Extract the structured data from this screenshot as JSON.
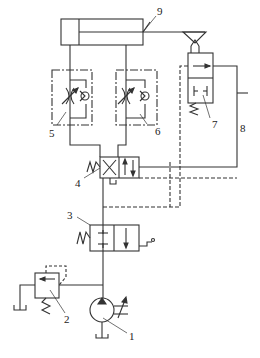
{
  "diagram": {
    "type": "hydraulic-circuit",
    "line_color": "#333333",
    "background": "#ffffff",
    "components": [
      {
        "id": "1",
        "label": "1",
        "name": "variable-displacement-pump"
      },
      {
        "id": "2",
        "label": "2",
        "name": "relief-valve"
      },
      {
        "id": "3",
        "label": "3",
        "name": "two-position-manual-directional-valve"
      },
      {
        "id": "4",
        "label": "4",
        "name": "two-position-four-way-pilot-directional-valve"
      },
      {
        "id": "5",
        "label": "5",
        "name": "one-way-throttle-valve-left"
      },
      {
        "id": "6",
        "label": "6",
        "name": "one-way-throttle-valve-right"
      },
      {
        "id": "7",
        "label": "7",
        "name": "roller-operated-pilot-valve"
      },
      {
        "id": "8",
        "label": "8",
        "name": "pilot-line"
      },
      {
        "id": "9",
        "label": "9",
        "name": "hydraulic-cylinder"
      }
    ]
  }
}
